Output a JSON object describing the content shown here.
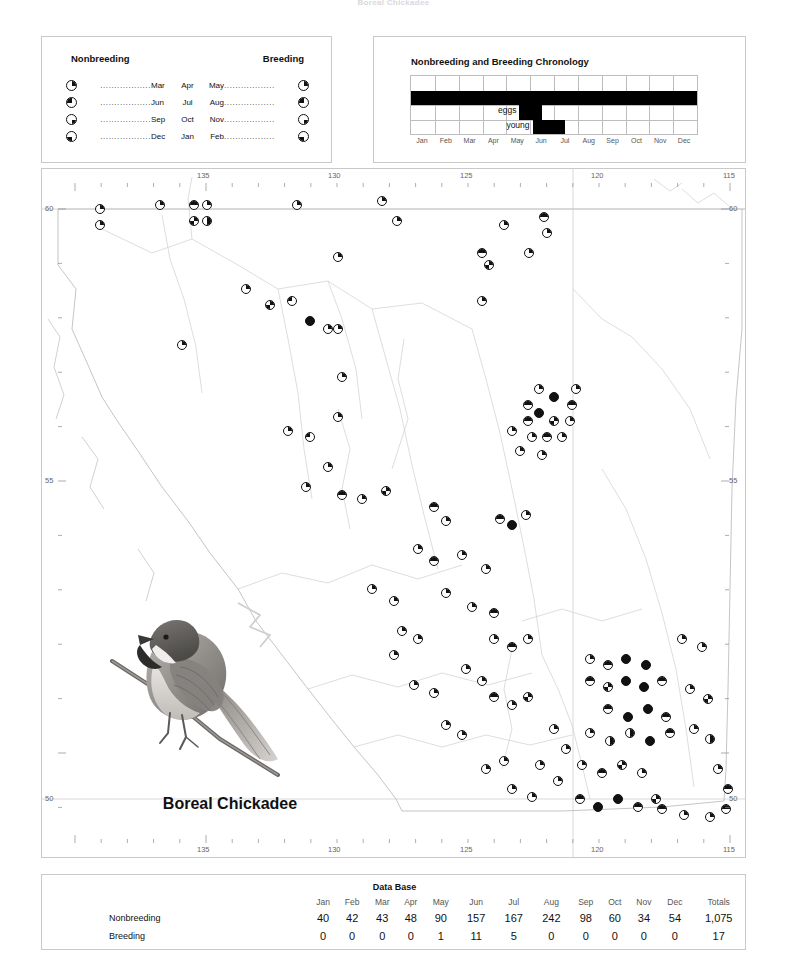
{
  "running_head": "Boreal Chickadee",
  "legend": {
    "panel_name": "seasonal-symbol-legend",
    "left_heading": "Nonbreeding",
    "right_heading": "Breeding",
    "dot_leader": "..................",
    "rows": [
      {
        "left_symbol": "pie-upper-right",
        "left_month": "Mar",
        "mid_month": "Apr",
        "right_month": "May",
        "right_symbol": "pie-upper-right"
      },
      {
        "left_symbol": "pie-upper-left",
        "left_month": "Jun",
        "mid_month": "Jul",
        "right_month": "Aug",
        "right_symbol": "pie-upper-left"
      },
      {
        "left_symbol": "pie-lower-right",
        "left_month": "Sep",
        "mid_month": "Oct",
        "right_month": "Nov",
        "right_symbol": "pie-lower-right"
      },
      {
        "left_symbol": "pie-lower-left",
        "left_month": "Dec",
        "mid_month": "Jan",
        "right_month": "Feb",
        "right_symbol": "pie-lower-left"
      }
    ]
  },
  "chronology": {
    "title": "Nonbreeding and Breeding Chronology",
    "months": [
      "Jan",
      "Feb",
      "Mar",
      "Apr",
      "May",
      "Jun",
      "Jul",
      "Aug",
      "Sep",
      "Oct",
      "Nov",
      "Dec"
    ],
    "row_labels": {
      "eggs": "eggs",
      "young": "young"
    },
    "bars": [
      {
        "name": "nonbreeding",
        "row": 1,
        "start_month": 0.0,
        "end_month": 12.0
      },
      {
        "name": "eggs",
        "row": 2,
        "start_month": 4.55,
        "end_month": 5.5
      },
      {
        "name": "young",
        "row": 3,
        "start_month": 5.1,
        "end_month": 6.45
      }
    ]
  },
  "map": {
    "name": "british-columbia-distribution-map",
    "longitude_labels": [
      "135",
      "130",
      "125",
      "120",
      "115"
    ],
    "latitude_labels": [
      "60",
      "55",
      "50"
    ],
    "species_caption": "Boreal Chickadee",
    "illustration": "boreal-chickadee-perched-on-branch"
  },
  "database": {
    "title": "Data Base",
    "columns": [
      "Jan",
      "Feb",
      "Mar",
      "Apr",
      "May",
      "Jun",
      "Jul",
      "Aug",
      "Sep",
      "Oct",
      "Nov",
      "Dec",
      "Totals"
    ],
    "rows": [
      {
        "label": "Nonbreeding",
        "values": [
          "40",
          "42",
          "43",
          "48",
          "90",
          "157",
          "167",
          "242",
          "98",
          "60",
          "34",
          "54",
          "1,075"
        ]
      },
      {
        "label": "Breeding",
        "values": [
          "0",
          "0",
          "0",
          "0",
          "1",
          "11",
          "5",
          "0",
          "0",
          "0",
          "0",
          "0",
          "17"
        ]
      }
    ]
  },
  "chart_data": {
    "type": "table",
    "title": "Data Base",
    "categories": [
      "Jan",
      "Feb",
      "Mar",
      "Apr",
      "May",
      "Jun",
      "Jul",
      "Aug",
      "Sep",
      "Oct",
      "Nov",
      "Dec"
    ],
    "series": [
      {
        "name": "Nonbreeding",
        "values": [
          40,
          42,
          43,
          48,
          90,
          157,
          167,
          242,
          98,
          60,
          34,
          54
        ],
        "total": 1075
      },
      {
        "name": "Breeding",
        "values": [
          0,
          0,
          0,
          0,
          1,
          11,
          5,
          0,
          0,
          0,
          0,
          0
        ],
        "total": 17
      }
    ],
    "xlabel": "Month",
    "ylabel": "Records",
    "grid": false,
    "legend_position": "left"
  }
}
